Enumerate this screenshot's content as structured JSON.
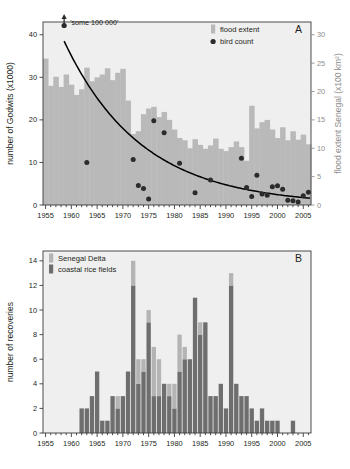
{
  "figure": {
    "background": "#ffffff",
    "colors": {
      "flood_bar": "#b9b9b9",
      "plot_bg": "#efefef",
      "senegal_delta": "#b4b4b4",
      "coastal_rice": "#6e6e6e",
      "point": "#2b2b2b",
      "trend_line": "#000000",
      "axis": "#3b3b3b",
      "right_axis": "#8d8d8d"
    }
  },
  "chart_data": [
    {
      "type": "bar",
      "panel_label": "A",
      "title": "",
      "xlabel": "",
      "ylabel": "number of Godwits (x1000)",
      "y2label": "flood extent Senegal (x100 km²)",
      "xlim": [
        1954.5,
        2006.5
      ],
      "ylim": [
        0,
        43
      ],
      "y2lim": [
        0,
        32.25
      ],
      "grid": false,
      "xticks": [
        1955,
        1960,
        1965,
        1970,
        1975,
        1980,
        1985,
        1990,
        1995,
        2000,
        2005
      ],
      "xtick_labels": [
        "1955",
        "1960",
        "1965",
        "1970",
        "1975",
        "1980",
        "1985",
        "1990",
        "1995",
        "2000",
        "2005"
      ],
      "xminor_step": 1,
      "yticks": [
        0,
        10,
        20,
        30,
        40
      ],
      "ytick_labels": [
        "0",
        "10",
        "20",
        "30",
        "40"
      ],
      "y2ticks": [
        0,
        5,
        10,
        15,
        20,
        25,
        30
      ],
      "y2tick_labels": [
        "0",
        "5",
        "10",
        "15",
        "20",
        "25",
        "30"
      ],
      "legend_position": "top-right",
      "legend": [
        {
          "label": "flood extent",
          "marker": "bar",
          "color": "#b9b9b9"
        },
        {
          "label": "bird count",
          "marker": "circle",
          "color": "#2b2b2b"
        }
      ],
      "annotation": {
        "text": "'some 100 000'",
        "x": 1958.6,
        "marker": "arrow-up-with-dot"
      },
      "series": [
        {
          "name": "flood extent",
          "axis": "right",
          "units": "x100 km2",
          "x": [
            1955,
            1956,
            1957,
            1958,
            1959,
            1960,
            1961,
            1962,
            1963,
            1964,
            1965,
            1966,
            1967,
            1968,
            1969,
            1970,
            1971,
            1972,
            1973,
            1974,
            1975,
            1976,
            1977,
            1978,
            1979,
            1980,
            1981,
            1982,
            1983,
            1984,
            1985,
            1986,
            1987,
            1988,
            1989,
            1990,
            1991,
            1992,
            1993,
            1994,
            1995,
            1996,
            1997,
            1998,
            1999,
            2000,
            2001,
            2002,
            2003,
            2004,
            2005,
            2006
          ],
          "values": [
            25.8,
            21.0,
            22.6,
            20.8,
            23.0,
            21.2,
            19.4,
            20.4,
            24.2,
            21.8,
            22.5,
            23.0,
            24.1,
            22.0,
            23.3,
            24.0,
            18.4,
            12.5,
            13.0,
            16.0,
            17.0,
            17.3,
            15.5,
            16.4,
            15.0,
            13.3,
            11.8,
            11.4,
            10.0,
            11.6,
            10.6,
            9.9,
            10.5,
            11.7,
            9.9,
            9.5,
            10.2,
            11.2,
            10.2,
            7.8,
            17.5,
            13.5,
            14.6,
            15.0,
            13.3,
            11.8,
            13.7,
            11.4,
            13.0,
            11.5,
            12.4,
            10.7
          ]
        },
        {
          "name": "bird count",
          "axis": "left",
          "units": "x1000",
          "points": [
            {
              "x": 1963,
              "y": 10.0
            },
            {
              "x": 1972,
              "y": 10.7
            },
            {
              "x": 1973,
              "y": 4.6
            },
            {
              "x": 1974,
              "y": 3.9
            },
            {
              "x": 1975,
              "y": 1.4
            },
            {
              "x": 1976,
              "y": 19.8
            },
            {
              "x": 1978,
              "y": 17.0
            },
            {
              "x": 1981,
              "y": 9.8
            },
            {
              "x": 1984,
              "y": 2.9
            },
            {
              "x": 1987,
              "y": 5.9
            },
            {
              "x": 1993,
              "y": 11.0
            },
            {
              "x": 1994,
              "y": 4.1
            },
            {
              "x": 1995,
              "y": 2.0
            },
            {
              "x": 1996,
              "y": 7.0
            },
            {
              "x": 1997,
              "y": 2.6
            },
            {
              "x": 1998,
              "y": 2.3
            },
            {
              "x": 1999,
              "y": 4.3
            },
            {
              "x": 2000,
              "y": 4.5
            },
            {
              "x": 2001,
              "y": 3.7
            },
            {
              "x": 2002,
              "y": 1.1
            },
            {
              "x": 2003,
              "y": 1.0
            },
            {
              "x": 2004,
              "y": 0.7
            },
            {
              "x": 2005,
              "y": 2.2
            },
            {
              "x": 2006,
              "y": 3.0
            }
          ]
        },
        {
          "name": "trend line",
          "axis": "left",
          "type": "decay",
          "x_start": 1958.6,
          "x_end": 2006.3,
          "y_start": 38.5,
          "y_end": 1.6
        }
      ]
    },
    {
      "type": "bar",
      "panel_label": "B",
      "title": "",
      "xlabel": "",
      "ylabel": "number of recoveries",
      "xlim": [
        1954.5,
        2006.5
      ],
      "ylim": [
        0,
        14.8
      ],
      "grid": false,
      "stacked": true,
      "xticks": [
        1955,
        1960,
        1965,
        1970,
        1975,
        1980,
        1985,
        1990,
        1995,
        2000,
        2005
      ],
      "xtick_labels": [
        "1955",
        "1960",
        "1965",
        "1970",
        "1975",
        "1980",
        "1985",
        "1990",
        "1995",
        "2000",
        "2005"
      ],
      "xminor_step": 1,
      "yticks": [
        0,
        2,
        4,
        6,
        8,
        10,
        12,
        14
      ],
      "ytick_labels": [
        "0",
        "2",
        "4",
        "6",
        "8",
        "10",
        "12",
        "14"
      ],
      "legend_position": "top-left",
      "legend": [
        {
          "label": "Senegal Delta",
          "marker": "bar",
          "color": "#b4b4b4"
        },
        {
          "label": "coastal rice fields",
          "marker": "bar",
          "color": "#6e6e6e"
        }
      ],
      "categories": [
        1962,
        1963,
        1964,
        1965,
        1966,
        1967,
        1968,
        1969,
        1970,
        1971,
        1972,
        1973,
        1974,
        1975,
        1976,
        1977,
        1978,
        1979,
        1980,
        1981,
        1982,
        1983,
        1984,
        1985,
        1986,
        1987,
        1988,
        1989,
        1990,
        1991,
        1992,
        1993,
        1994,
        1995,
        1996,
        1997,
        1998,
        1999,
        2000,
        2003
      ],
      "series": [
        {
          "name": "coastal rice fields",
          "color": "#6e6e6e",
          "values": [
            2,
            2,
            3,
            5,
            1,
            1,
            3,
            2,
            3,
            5,
            12,
            4,
            5,
            9,
            3,
            3,
            4,
            3,
            2,
            5,
            6,
            6,
            11,
            8,
            9,
            3,
            3,
            4,
            2,
            12,
            4,
            3,
            3,
            2,
            1,
            2,
            1,
            1,
            1,
            1
          ]
        },
        {
          "name": "Senegal Delta",
          "color": "#b4b4b4",
          "values": [
            0,
            0,
            0,
            0,
            0,
            0,
            0,
            1,
            0,
            0,
            2,
            2,
            1,
            1,
            4,
            3,
            0,
            1,
            2,
            3,
            1,
            0,
            0,
            1,
            0,
            0,
            0,
            0,
            0,
            1,
            0,
            0,
            0,
            0,
            0,
            0,
            0,
            0,
            0,
            0
          ]
        }
      ],
      "totals": [
        2,
        2,
        3,
        5,
        1,
        1,
        3,
        3,
        3,
        5,
        14,
        6,
        6,
        10,
        7,
        6,
        4,
        4,
        4,
        8,
        7,
        6,
        11,
        9,
        9,
        3,
        3,
        4,
        2,
        13,
        4,
        3,
        3,
        2,
        1,
        2,
        1,
        1,
        1,
        1
      ]
    }
  ]
}
